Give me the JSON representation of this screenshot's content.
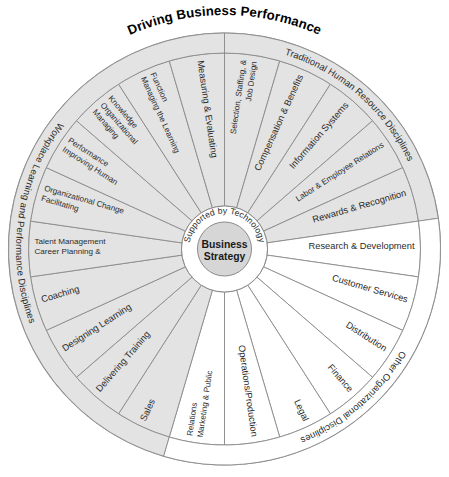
{
  "title": "Driving Business Performance",
  "hub": {
    "center_label_line1": "Business",
    "center_label_line2": "Strategy",
    "ring_label": "Supported by Technology"
  },
  "outer_rings": [
    {
      "id": "wlp",
      "label": "Workplace Learning and Performance Disciplines"
    },
    {
      "id": "thr",
      "label": "Traditional Human Resource Disciplines"
    },
    {
      "id": "ood",
      "label": "Other Organizational Disciplines"
    }
  ],
  "colors": {
    "shaded_segment": "#e3e3e3",
    "plain_segment": "#ffffff",
    "hub_inner": "#d6d6d6",
    "stroke": "#8a8a8a",
    "text": "#2b2b2b"
  },
  "chart_data": {
    "type": "pie",
    "title": "Driving Business Performance",
    "center": "Business Strategy",
    "inner_ring": "Supported by Technology",
    "categories": [
      "Selection, Staffing, & Job Design",
      "Compensation & Benefits",
      "Information Systems",
      "Labor & Employee Relations",
      "Rewards & Recognition",
      "Research & Development",
      "Customer Services",
      "Distribution",
      "Finance",
      "Legal",
      "Operations/Production",
      "Marketing & Public Relations",
      "Sales",
      "Delivering Training",
      "Designing Learning",
      "Coaching",
      "Career Planning & Talent Management",
      "Facilitating Organizational Change",
      "Improving Human Performance",
      "Managing Organizational Knowledge",
      "Managing the Learning Function",
      "Measuring & Evaluating"
    ],
    "values": [
      1,
      1,
      1,
      1,
      1,
      1,
      1,
      1,
      1,
      1,
      1,
      1,
      1,
      1,
      1,
      1,
      1,
      1,
      1,
      1,
      1,
      1
    ],
    "groups": [
      {
        "name": "Traditional Human Resource Disciplines",
        "shaded": true,
        "members": [
          "Selection, Staffing, & Job Design",
          "Compensation & Benefits",
          "Information Systems",
          "Labor & Employee Relations",
          "Rewards & Recognition"
        ]
      },
      {
        "name": "Other Organizational Disciplines",
        "shaded": false,
        "members": [
          "Research & Development",
          "Customer Services",
          "Distribution",
          "Finance",
          "Legal",
          "Operations/Production",
          "Marketing & Public Relations"
        ]
      },
      {
        "name": "Workplace Learning and Performance Disciplines",
        "shaded": true,
        "members": [
          "Sales",
          "Delivering Training",
          "Designing Learning",
          "Coaching",
          "Career Planning & Talent Management",
          "Facilitating Organizational Change",
          "Improving Human Performance",
          "Managing Organizational Knowledge",
          "Managing the Learning Function",
          "Measuring & Evaluating"
        ]
      }
    ],
    "legend": "none",
    "grid": false
  },
  "segments": [
    {
      "label": "Selection, Staffing, & Job Design",
      "shaded": true,
      "group": "thr",
      "size": 1.6
    },
    {
      "label": "Compensation & Benefits",
      "shaded": true,
      "group": "thr",
      "size": 1.6
    },
    {
      "label": "Information Systems",
      "shaded": true,
      "group": "thr",
      "size": 1.6
    },
    {
      "label": "Labor & Employee Relations",
      "shaded": true,
      "group": "thr",
      "size": 1.6
    },
    {
      "label": "Rewards & Recognition",
      "shaded": true,
      "group": "thr",
      "size": 1.6
    },
    {
      "label": "Research & Development",
      "shaded": false,
      "group": "ood",
      "size": 1.6
    },
    {
      "label": "Customer Services",
      "shaded": false,
      "group": "ood",
      "size": 1.6
    },
    {
      "label": "Distribution",
      "shaded": false,
      "group": "ood",
      "size": 1.6
    },
    {
      "label": "Finance",
      "shaded": false,
      "group": "ood",
      "size": 1.6
    },
    {
      "label": "Legal",
      "shaded": false,
      "group": "ood",
      "size": 1.6
    },
    {
      "label": "Operations/Production",
      "shaded": false,
      "group": "ood",
      "size": 1.6
    },
    {
      "label": "Marketing & Public Relations",
      "shaded": false,
      "group": "ood",
      "size": 1.6
    },
    {
      "label": "Sales",
      "shaded": true,
      "group": "wlp",
      "size": 1.6
    },
    {
      "label": "Delivering Training",
      "shaded": true,
      "group": "wlp",
      "size": 1.6
    },
    {
      "label": "Designing Learning",
      "shaded": true,
      "group": "wlp",
      "size": 1.6
    },
    {
      "label": "Coaching",
      "shaded": true,
      "group": "wlp",
      "size": 1.6
    },
    {
      "label": "Career Planning & Talent Management",
      "shaded": true,
      "group": "wlp",
      "size": 1.6
    },
    {
      "label": "Facilitating Organizational Change",
      "shaded": true,
      "group": "wlp",
      "size": 1.6
    },
    {
      "label": "Improving Human Performance",
      "shaded": true,
      "group": "wlp",
      "size": 1.6
    },
    {
      "label": "Managing Organizational Knowledge",
      "shaded": true,
      "group": "wlp",
      "size": 1.6
    },
    {
      "label": "Managing the Learning Function",
      "shaded": true,
      "group": "wlp",
      "size": 1.6
    },
    {
      "label": "Measuring & Evaluating",
      "shaded": true,
      "group": "wlp",
      "size": 1.6
    }
  ]
}
